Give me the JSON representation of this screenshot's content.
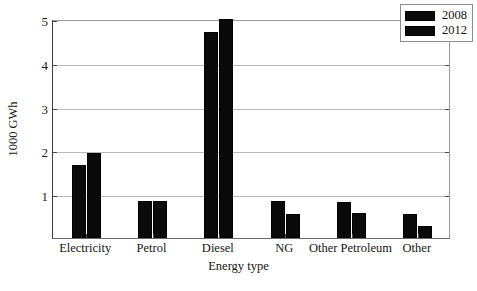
{
  "chart_data": {
    "type": "bar",
    "title": "",
    "xlabel": "Energy type",
    "ylabel": "1000 GWh",
    "categories": [
      "Electricity",
      "Petrol",
      "Diesel",
      "NG",
      "Other Petroleum",
      "Other"
    ],
    "series": [
      {
        "name": "2008",
        "values": [
          1.67,
          0.84,
          4.7,
          0.84,
          0.82,
          0.55
        ]
      },
      {
        "name": "2012",
        "values": [
          1.94,
          0.84,
          4.99,
          0.55,
          0.56,
          0.28
        ]
      }
    ],
    "ylim": [
      0,
      5
    ],
    "yticks": [
      1,
      2,
      3,
      4,
      5
    ],
    "ytick_labels": [
      "1",
      "2",
      "3",
      "4",
      "5"
    ],
    "grid": true,
    "legend_position": "top-right",
    "series_color": "#0a0a0a"
  }
}
